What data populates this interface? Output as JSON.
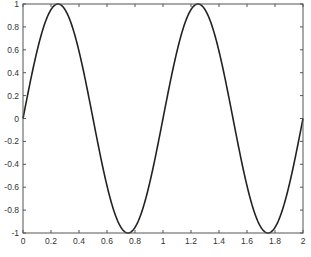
{
  "chart_data": {
    "type": "line",
    "title": "",
    "xlabel": "",
    "ylabel": "",
    "xlim": [
      0,
      2
    ],
    "ylim": [
      -1,
      1
    ],
    "grid": false,
    "legend": null,
    "function": "y = sin(2*pi*x)",
    "x_ticks": [
      0,
      0.2,
      0.4,
      0.6,
      0.8,
      1,
      1.2,
      1.4,
      1.6,
      1.8,
      2
    ],
    "x_tick_labels": [
      "0",
      "0.2",
      "0.4",
      "0.6",
      "0.8",
      "1",
      "1.2",
      "1.4",
      "1.6",
      "1.8",
      "2"
    ],
    "y_ticks": [
      -1,
      -0.8,
      -0.6,
      -0.4,
      -0.2,
      0,
      0.2,
      0.4,
      0.6,
      0.8,
      1
    ],
    "y_tick_labels": [
      "-1",
      "-0.8",
      "-0.6",
      "-0.4",
      "-0.2",
      "0",
      "0.2",
      "0.4",
      "0.6",
      "0.8",
      "1"
    ],
    "series": [
      {
        "name": "sin(2πx)",
        "color": "#222222",
        "x": [
          0,
          0.125,
          0.25,
          0.375,
          0.5,
          0.625,
          0.75,
          0.875,
          1,
          1.125,
          1.25,
          1.375,
          1.5,
          1.625,
          1.75,
          1.875,
          2
        ],
        "values": [
          0,
          0.707,
          1,
          0.707,
          0,
          -0.707,
          -1,
          -0.707,
          0,
          0.707,
          1,
          0.707,
          0,
          -0.707,
          -1,
          -0.707,
          0
        ]
      }
    ]
  },
  "plot": {
    "axis_color": "#555555",
    "line_color": "#222222",
    "background": "#ffffff"
  }
}
